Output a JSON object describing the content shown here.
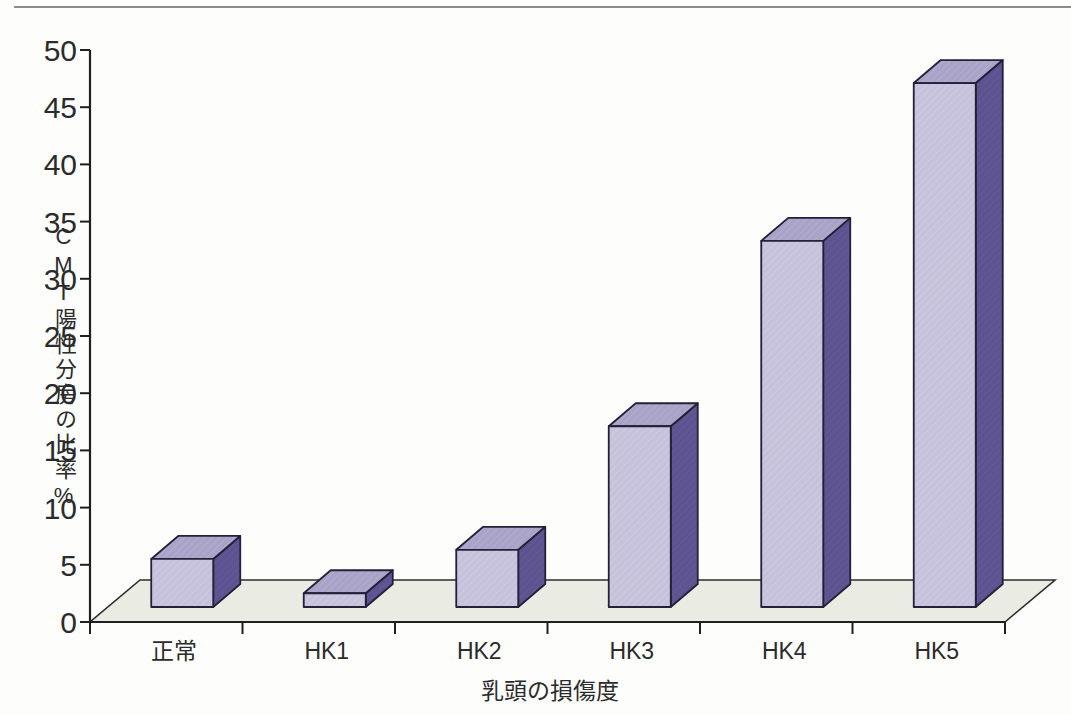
{
  "page": {
    "background": "#fdfdfb",
    "top_rule_color": "#8c8c8c"
  },
  "chart_data": {
    "type": "bar",
    "style": "3d-column",
    "title": "",
    "categories": [
      "正常",
      "HK1",
      "HK2",
      "HK3",
      "HK4",
      "HK5"
    ],
    "values": [
      4.2,
      1.2,
      5.0,
      15.8,
      32.0,
      45.8
    ],
    "xlabel": "乳頭の損傷度",
    "ylabel": "CMT陽性分房の比率%",
    "ylim": [
      0,
      50
    ],
    "ytick_step": 5,
    "yticks": [
      0,
      5,
      10,
      15,
      20,
      25,
      30,
      35,
      40,
      45,
      50
    ],
    "grid": false,
    "legend": "none",
    "colors": {
      "bar_front": "#c6c2db",
      "bar_top": "#aaa3c8",
      "bar_side": "#5d5390",
      "bar_outline": "#23203a",
      "floor": "#eaebe3",
      "floor_outline": "#2c2c2c",
      "axis": "#1f1f1f",
      "text": "#2b2b2b"
    }
  }
}
